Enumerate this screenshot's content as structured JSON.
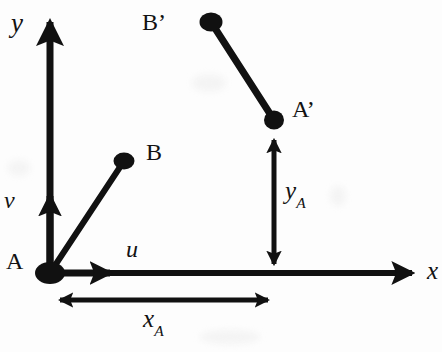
{
  "figure": {
    "background_color": "#fdfdfd",
    "ink_color": "#111111"
  },
  "axes": {
    "x_label": "x",
    "y_label": "y",
    "origin": {
      "x": 50,
      "y": 273
    },
    "x_axis_end": {
      "x": 425,
      "y": 273
    },
    "y_axis_end": {
      "x": 47,
      "y": 10
    }
  },
  "points": [
    {
      "name": "A",
      "label": "A",
      "cx": 50,
      "cy": 273,
      "rx": 15,
      "ry": 11
    },
    {
      "name": "B",
      "label": "B",
      "cx": 124,
      "cy": 161,
      "rx": 10,
      "ry": 8
    },
    {
      "name": "A'",
      "label": "A’",
      "cx": 274,
      "cy": 120,
      "rx": 10,
      "ry": 9
    },
    {
      "name": "B'",
      "label": "B’",
      "cx": 211,
      "cy": 22,
      "rx": 11,
      "ry": 9
    }
  ],
  "rods": [
    {
      "name": "rod-AB",
      "from": "A",
      "to": "B"
    },
    {
      "name": "rod-A'B'",
      "from": "A’",
      "to": "B’"
    }
  ],
  "vectors": {
    "u": {
      "label": "u",
      "from": {
        "x": 50,
        "y": 273
      },
      "to": {
        "x": 120,
        "y": 273
      }
    },
    "v": {
      "label": "v",
      "from": {
        "x": 50,
        "y": 273
      },
      "to": {
        "x": 50,
        "y": 186
      }
    }
  },
  "dimensions": {
    "x_A": {
      "label": "x",
      "subscript": "A",
      "from": {
        "x": 50,
        "y": 300
      },
      "to": {
        "x": 278,
        "y": 300
      },
      "double_headed": true
    },
    "y_A": {
      "label": "y",
      "subscript": "A",
      "from": {
        "x": 274,
        "y": 131
      },
      "to": {
        "x": 274,
        "y": 272
      },
      "double_headed": true
    }
  },
  "labels": [
    {
      "name": "axis-label-y",
      "text": "y",
      "x": 11,
      "y": 10,
      "size": 27,
      "style": "italic"
    },
    {
      "name": "axis-label-x",
      "text": "x",
      "x": 427,
      "y": 258,
      "size": 25,
      "style": "italic"
    },
    {
      "name": "point-label-A",
      "text": "A",
      "x": 6,
      "y": 249,
      "size": 24,
      "style": "upright"
    },
    {
      "name": "point-label-B",
      "text": "B",
      "x": 146,
      "y": 140,
      "size": 24,
      "style": "upright"
    },
    {
      "name": "point-label-A-prime",
      "text": "A’",
      "x": 292,
      "y": 97,
      "size": 24,
      "style": "upright"
    },
    {
      "name": "point-label-B-prime",
      "text": "B’",
      "x": 142,
      "y": 10,
      "size": 24,
      "style": "upright"
    },
    {
      "name": "vector-label-u",
      "text": "u",
      "x": 126,
      "y": 237,
      "size": 24,
      "style": "italic"
    },
    {
      "name": "vector-label-v",
      "text": "v",
      "x": 4,
      "y": 188,
      "size": 24,
      "style": "italic"
    }
  ],
  "dimension_labels": [
    {
      "name": "dimension-label-x-A",
      "base": "x",
      "subscript": "A",
      "x": 143,
      "y": 306,
      "size": 25
    },
    {
      "name": "dimension-label-y-A",
      "base": "y",
      "subscript": "A",
      "x": 285,
      "y": 178,
      "size": 25
    }
  ]
}
